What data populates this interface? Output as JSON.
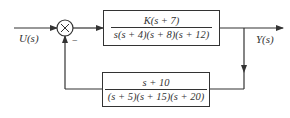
{
  "diagram": {
    "type": "feedback-control-block-diagram",
    "input": {
      "label": "U(s)"
    },
    "output": {
      "label": "Y(s)"
    },
    "summing_junction": {
      "symbol": "×",
      "feedback_sign": "−"
    },
    "forward_block": {
      "numerator": "K(s + 7)",
      "denominator": "s(s + 4)(s + 8)(s + 12)"
    },
    "feedback_block": {
      "numerator": "s + 10",
      "denominator": "(s + 5)(s + 15)(s + 20)"
    }
  },
  "colors": {
    "line": "#333333",
    "background": "#ffffff"
  }
}
